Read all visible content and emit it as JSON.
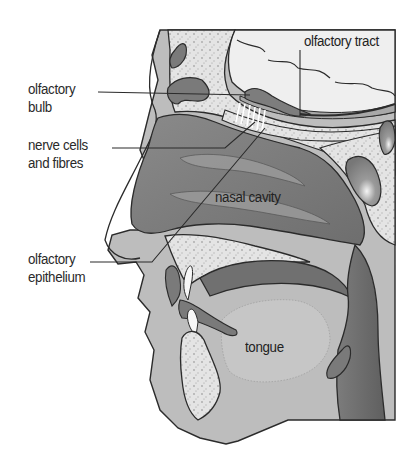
{
  "figure": {
    "labels": {
      "olfactory_bulb": {
        "line1": "olfactory",
        "line2": "bulb"
      },
      "nerve_cells": {
        "line1": "nerve cells",
        "line2": "and fibres"
      },
      "olfactory_epithelium": {
        "line1": "olfactory",
        "line2": "epithelium"
      },
      "olfactory_tract": "olfactory tract",
      "nasal_cavity": "nasal cavity",
      "tongue": "tongue"
    },
    "colors": {
      "background": "#ffffff",
      "outline": "#2b2b2b",
      "bone": "#e6e6e6",
      "bone_speckle": "#a8a8a8",
      "soft_tissue": "#bdbdbd",
      "cavity_dark": "#7a7a7a",
      "cavity_mid": "#8e8e8e",
      "brain_light": "#efefef",
      "tongue": "#c4c4c4",
      "teeth": "#f7f7f7"
    }
  }
}
